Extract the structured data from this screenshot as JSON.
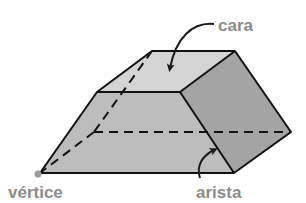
{
  "diagram": {
    "type": "labeled-geometry",
    "labels": {
      "face": "cara",
      "vertex": "vértice",
      "edge": "arista"
    },
    "colors": {
      "top_face": "#d4d4d4",
      "front_face": "#bdbdbd",
      "side_face": "#a4a4a4",
      "edge_line": "#111111",
      "label_text": "#8c8c8c",
      "vertex_dot": "#9a9a9a"
    }
  }
}
